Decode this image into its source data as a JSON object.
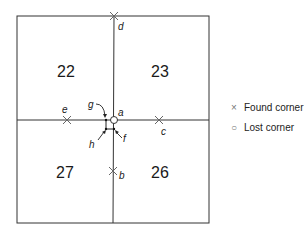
{
  "diagram": {
    "sections": [
      {
        "label": "22",
        "x": 66,
        "y": 77
      },
      {
        "label": "23",
        "x": 160,
        "y": 77
      },
      {
        "label": "27",
        "x": 65,
        "y": 178
      },
      {
        "label": "26",
        "x": 160,
        "y": 178
      }
    ],
    "found_corners": [
      {
        "id": "d",
        "x": 114,
        "y": 16,
        "lx": 118,
        "ly": 30
      },
      {
        "id": "e",
        "x": 67,
        "y": 120,
        "lx": 62,
        "ly": 113
      },
      {
        "id": "c",
        "x": 159,
        "y": 120,
        "lx": 161,
        "ly": 134
      },
      {
        "id": "b",
        "x": 113,
        "y": 171,
        "lx": 119,
        "ly": 179
      }
    ],
    "lost_corner": {
      "id": "a",
      "x": 114,
      "y": 120,
      "lx": 118,
      "ly": 116
    },
    "pointers": [
      {
        "id": "g",
        "lx": 88,
        "ly": 108
      },
      {
        "id": "h",
        "lx": 89,
        "ly": 148
      },
      {
        "id": "f",
        "lx": 123,
        "ly": 142
      }
    ]
  },
  "legend": {
    "found": {
      "symbol": "×",
      "label": "Found corner"
    },
    "lost": {
      "symbol": "○",
      "label": "Lost corner"
    }
  },
  "labels": {
    "s0": "22",
    "s1": "23",
    "s2": "27",
    "s3": "26",
    "a": "a",
    "b": "b",
    "c": "c",
    "d": "d",
    "e": "e",
    "f": "f",
    "g": "g",
    "h": "h"
  }
}
